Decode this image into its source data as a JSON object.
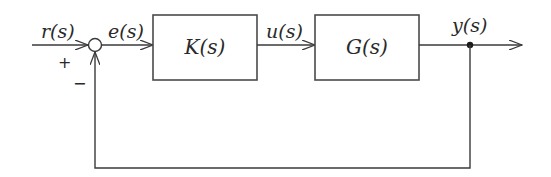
{
  "diagram": {
    "type": "feedback-control-block-diagram",
    "signals": {
      "reference": "r(s)",
      "error": "e(s)",
      "control": "u(s)",
      "output": "y(s)"
    },
    "summing_junction": {
      "plus_sign": "+",
      "minus_sign": "−"
    },
    "blocks": [
      {
        "id": "controller",
        "label": "K(s)"
      },
      {
        "id": "plant",
        "label": "G(s)"
      }
    ],
    "colors": {
      "line": "#3a3a3a",
      "block_border": "#4a4a4a",
      "background": "#ffffff"
    }
  }
}
